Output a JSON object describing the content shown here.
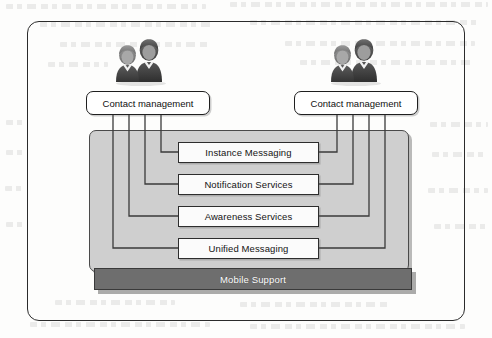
{
  "diagram": {
    "outer_frame": {
      "shape": "rounded-rectangle"
    },
    "actors": [
      {
        "id": "actor-left",
        "icon": "two-people-icon",
        "side": "left"
      },
      {
        "id": "actor-right",
        "icon": "two-people-icon",
        "side": "right"
      }
    ],
    "contact_boxes": [
      {
        "id": "contact-management-left",
        "label": "Contact management"
      },
      {
        "id": "contact-management-right",
        "label": "Contact management"
      }
    ],
    "services": [
      {
        "id": "instance-messaging",
        "label": "Instance Messaging"
      },
      {
        "id": "notification-services",
        "label": "Notification Services"
      },
      {
        "id": "awareness-services",
        "label": "Awareness Services"
      },
      {
        "id": "unified-messaging",
        "label": "Unified Messaging"
      }
    ],
    "platform_bar": {
      "id": "mobile-support",
      "label": "Mobile Support"
    },
    "colors": {
      "panel_fill": "#cfcfcf",
      "panel_stroke": "#4a4a4a",
      "bar_fill": "#6e6e6e",
      "bar_text": "#ffffff",
      "box_fill": "#fbfbfb",
      "box_stroke": "#2d2d2d",
      "frame_stroke": "#2b2b2b",
      "connector_stroke": "#3b3b3b",
      "page_background": "#fdfdfc"
    },
    "connections": {
      "left_to_services": [
        "instance-messaging",
        "notification-services",
        "awareness-services",
        "unified-messaging"
      ],
      "right_to_services": [
        "instance-messaging",
        "notification-services",
        "awareness-services",
        "unified-messaging"
      ]
    }
  }
}
